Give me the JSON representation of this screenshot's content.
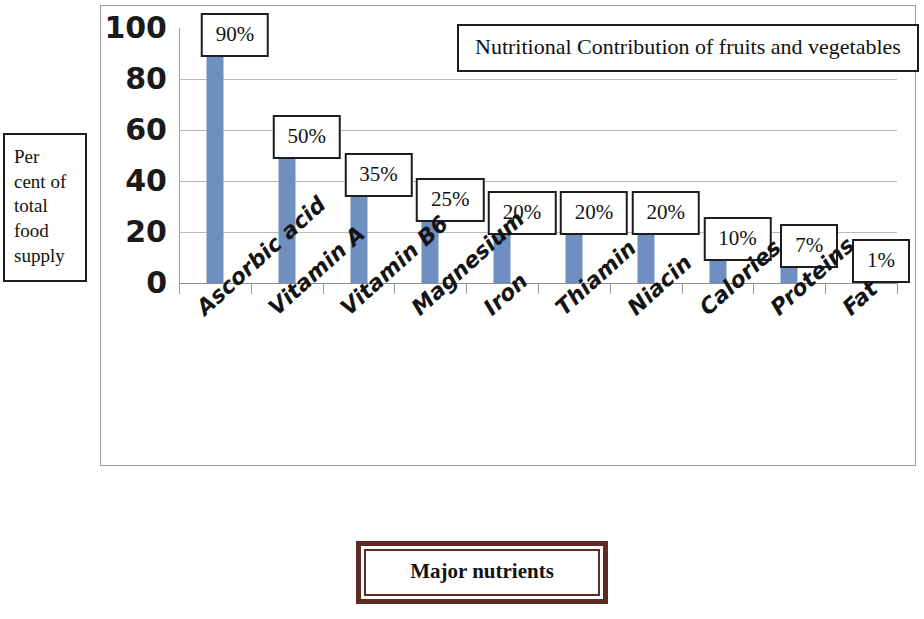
{
  "chart_data": {
    "type": "bar",
    "title": "Nutritional Contribution of fruits and vegetables",
    "xlabel": "Major nutrients",
    "ylabel": "Per cent of total food supply",
    "categories": [
      "Ascorbic acid",
      "Vitamin A",
      "Vitamin B6",
      "Magnesium",
      "Iron",
      "Thiamin",
      "Niacin",
      "Calories",
      "Proteins",
      "Fat"
    ],
    "values": [
      90,
      50,
      35,
      25,
      20,
      20,
      20,
      10,
      7,
      1
    ],
    "data_labels": [
      "90%",
      "50%",
      "35%",
      "25%",
      "20%",
      "20%",
      "20%",
      "10%",
      "7%",
      "1%"
    ],
    "ylim": [
      0,
      100
    ],
    "yticks": [
      100,
      80,
      60,
      40,
      20,
      0
    ],
    "ytick_labels": [
      "100",
      "80",
      "60",
      "40",
      "20",
      "0"
    ],
    "grid": true,
    "legend": false,
    "series_color": "#6e8fc0"
  },
  "y_axis_title_lines": [
    "Per",
    "cent of",
    "total",
    "food",
    "supply"
  ],
  "colors": {
    "bar": "#6e8fc0",
    "axis": "#9b9b9b",
    "gridline": "#b9b9b9",
    "label_border": "#1d1d1d",
    "xtitle_border": "#5c2b22",
    "text": "#111111",
    "background": "#ffffff"
  }
}
